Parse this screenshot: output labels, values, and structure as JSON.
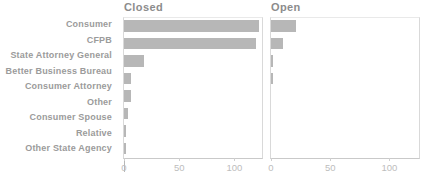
{
  "chart_data": {
    "type": "bar",
    "orientation": "horizontal",
    "categories": [
      "Consumer",
      "CFPB",
      "State Attorney General",
      "Better Business Bureau",
      "Consumer Attorney",
      "Other",
      "Consumer Spouse",
      "Relative",
      "Other State Agency"
    ],
    "facets": [
      {
        "title": "Closed",
        "values": [
          122,
          120,
          18,
          6,
          6,
          4,
          2,
          2,
          0.5
        ]
      },
      {
        "title": "Open",
        "values": [
          21,
          10,
          2,
          2,
          0,
          0,
          0,
          0,
          0
        ]
      }
    ],
    "xticks": [
      0,
      50,
      100
    ],
    "xlim": [
      0,
      125
    ],
    "grid": false,
    "legend": "none",
    "bar_color": "#b7b7b7"
  },
  "colors": {
    "bar": "#b7b7b7",
    "facet_title": "#8c8c8c",
    "category_label": "#9b9b9b",
    "tick_label": "#bdbdbd",
    "spine": "#d9d9d9",
    "background": "#ffffff"
  }
}
